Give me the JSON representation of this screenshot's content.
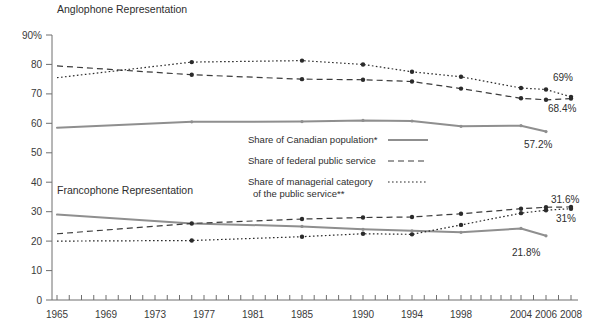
{
  "chart_data": {
    "type": "line",
    "title": "",
    "xlabel": "",
    "ylabel": "",
    "ylim": [
      0,
      90
    ],
    "xlim": [
      1965,
      2008
    ],
    "grid": false,
    "legend_position": "center",
    "annotations": {
      "anglophone_group": "Anglophone Representation",
      "francophone_group": "Francophone Representation"
    },
    "x_tick_labels": [
      "1965",
      "1969",
      "1973",
      "1977",
      "1981",
      "1985",
      "1990",
      "1994",
      "1998",
      "2004",
      "2006",
      "2008"
    ],
    "x_tick_values": [
      1965,
      1969,
      1973,
      1977,
      1981,
      1985,
      1990,
      1994,
      1998,
      2004,
      2006,
      2008
    ],
    "y_tick_labels": [
      "0",
      "10",
      "20",
      "30",
      "40",
      "50",
      "60",
      "70",
      "80",
      "90%"
    ],
    "y_tick_values": [
      0,
      10,
      20,
      30,
      40,
      50,
      60,
      70,
      80,
      90
    ],
    "series": [
      {
        "name": "Share of Canadian population*",
        "group": "Anglophone Representation",
        "style": "solid",
        "color": "#8f8f8f",
        "x": [
          1965,
          1976,
          1985,
          1990,
          1994,
          1998,
          2004,
          2006
        ],
        "values": [
          58.5,
          60.5,
          60.6,
          61.0,
          60.8,
          59.0,
          59.2,
          57.2
        ],
        "end_label": "57.2%"
      },
      {
        "name": "Share of federal public service",
        "group": "Anglophone Representation",
        "style": "dashed",
        "color": "#3c3c3c",
        "x": [
          1965,
          1976,
          1985,
          1990,
          1994,
          1998,
          2004,
          2006,
          2008
        ],
        "values": [
          79.5,
          76.5,
          75.0,
          74.8,
          74.2,
          71.8,
          68.5,
          68.0,
          68.4
        ],
        "end_label": "68.4%"
      },
      {
        "name": "Share of managerial category of the public service**",
        "group": "Anglophone Representation",
        "style": "dotted",
        "color": "#2b2b2b",
        "x": [
          1965,
          1976,
          1985,
          1990,
          1994,
          1998,
          2004,
          2006,
          2008
        ],
        "values": [
          75.5,
          80.8,
          81.3,
          80.0,
          77.5,
          75.8,
          72.0,
          71.5,
          69.0
        ],
        "end_label": "69%"
      },
      {
        "name": "Share of Canadian population*",
        "group": "Francophone Representation",
        "style": "solid",
        "color": "#8f8f8f",
        "x": [
          1965,
          1976,
          1985,
          1990,
          1994,
          1998,
          2004,
          2006
        ],
        "values": [
          29.0,
          26.0,
          25.0,
          24.0,
          23.5,
          23.0,
          24.3,
          21.8
        ],
        "end_label": "21.8%"
      },
      {
        "name": "Share of federal public service",
        "group": "Francophone Representation",
        "style": "dashed",
        "color": "#3c3c3c",
        "x": [
          1965,
          1976,
          1985,
          1990,
          1994,
          1998,
          2004,
          2006,
          2008
        ],
        "values": [
          22.5,
          26.0,
          27.5,
          28.0,
          28.2,
          29.3,
          31.0,
          31.5,
          31.6
        ],
        "end_label": "31.6%"
      },
      {
        "name": "Share of managerial category of the public service**",
        "group": "Francophone Representation",
        "style": "dotted",
        "color": "#2b2b2b",
        "x": [
          1965,
          1976,
          1985,
          1990,
          1994,
          1998,
          2004,
          2006,
          2008
        ],
        "values": [
          20.0,
          20.2,
          21.5,
          22.5,
          22.3,
          25.5,
          29.5,
          30.5,
          31.0
        ],
        "end_label": "31%"
      }
    ],
    "legend_entries": [
      {
        "label_line1": "Share of Canadian population*",
        "label_line2": "",
        "style": "solid"
      },
      {
        "label_line1": "Share of federal public service",
        "label_line2": "",
        "style": "dashed"
      },
      {
        "label_line1": "Share of managerial category",
        "label_line2": "of the public service**",
        "style": "dotted"
      }
    ],
    "endpoint_labels": [
      {
        "text": "69%",
        "series": "managerial-anglophone"
      },
      {
        "text": "68.4%",
        "series": "federal-anglophone"
      },
      {
        "text": "57.2%",
        "series": "population-anglophone"
      },
      {
        "text": "31.6%",
        "series": "federal-francophone"
      },
      {
        "text": "31%",
        "series": "managerial-francophone"
      },
      {
        "text": "21.8%",
        "series": "population-francophone"
      }
    ]
  }
}
